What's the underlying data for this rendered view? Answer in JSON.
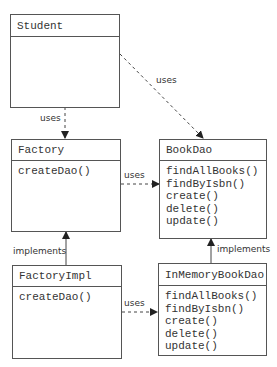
{
  "diagram": {
    "type": "UML class diagram",
    "classes": {
      "student": {
        "name": "Student",
        "operations": []
      },
      "factory": {
        "name": "Factory",
        "operations": [
          "createDao()"
        ]
      },
      "book_dao": {
        "name": "BookDao",
        "operations": [
          "findAllBooks()",
          "findByIsbn()",
          "create()",
          "delete()",
          "update()"
        ]
      },
      "factory_impl": {
        "name": "FactoryImpl",
        "operations": [
          "createDao()"
        ]
      },
      "in_memory_book_dao": {
        "name": "InMemoryBookDao",
        "operations": [
          "findAllBooks()",
          "findByIsbn()",
          "create()",
          "delete()",
          "update()"
        ]
      }
    },
    "relations": {
      "student_factory": {
        "label": "uses",
        "from": "Student",
        "to": "Factory",
        "style": "dashed"
      },
      "student_bookdao": {
        "label": "uses",
        "from": "Student",
        "to": "BookDao",
        "style": "dashed"
      },
      "factory_bookdao": {
        "label": "uses",
        "from": "Factory",
        "to": "BookDao",
        "style": "dashed"
      },
      "factoryimpl_factory": {
        "label": "implements",
        "from": "FactoryImpl",
        "to": "Factory",
        "style": "solid"
      },
      "inmemory_bookdao": {
        "label": "implements",
        "from": "InMemoryBookDao",
        "to": "BookDao",
        "style": "solid"
      },
      "factoryimpl_inmemory": {
        "label": "uses",
        "from": "FactoryImpl",
        "to": "InMemoryBookDao",
        "style": "dashed"
      }
    },
    "colors": {
      "line": "#333333",
      "border": "#555555",
      "text": "#333333"
    }
  }
}
